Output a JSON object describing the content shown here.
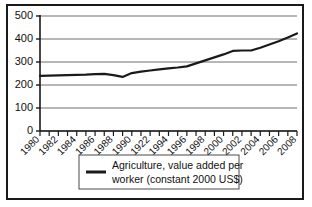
{
  "chart_data": {
    "type": "line",
    "title": "",
    "xlabel": "",
    "ylabel": "",
    "ylim": [
      0,
      500
    ],
    "xlim": [
      1980,
      2008
    ],
    "grid": true,
    "legend_position": "bottom",
    "y_ticks": [
      0,
      100,
      200,
      300,
      400,
      500
    ],
    "x_tick_labels": [
      "1980",
      "1982",
      "1984",
      "1986",
      "1988",
      "1990",
      "1922",
      "1994",
      "1996",
      "1998",
      "2000",
      "2002",
      "2004",
      "2006",
      "2008"
    ],
    "x_minor_years": [
      1980,
      1981,
      1982,
      1983,
      1984,
      1985,
      1986,
      1987,
      1988,
      1989,
      1990,
      1991,
      1992,
      1993,
      1994,
      1995,
      1996,
      1997,
      1998,
      1999,
      2000,
      2001,
      2002,
      2003,
      2004,
      2005,
      2006,
      2007,
      2008
    ],
    "series": [
      {
        "name": "Agriculture, value added per worker (constant 2000 US$)",
        "color": "#1a1a1a",
        "x": [
          1980,
          1981,
          1982,
          1983,
          1984,
          1985,
          1986,
          1987,
          1988,
          1989,
          1990,
          1991,
          1992,
          1993,
          1994,
          1995,
          1996,
          1997,
          1998,
          1999,
          2000,
          2001,
          2002,
          2003,
          2004,
          2005,
          2006,
          2007,
          2008
        ],
        "values": [
          240,
          241,
          242,
          243,
          244,
          245,
          247,
          248,
          243,
          235,
          252,
          258,
          263,
          268,
          272,
          276,
          281,
          294,
          307,
          320,
          333,
          348,
          350,
          350,
          362,
          376,
          390,
          407,
          424
        ]
      }
    ],
    "legend": [
      {
        "label_line_1": "Agriculture, value added per",
        "label_line_2": "worker (constant 2000 US$)",
        "color": "#1a1a1a"
      }
    ],
    "colors": {
      "line": "#1a1a1a",
      "grid": "#6e6e6e",
      "axis": "#1a1a1a",
      "border": "#1a1a1a",
      "background": "#ffffff",
      "text": "#111111"
    }
  }
}
